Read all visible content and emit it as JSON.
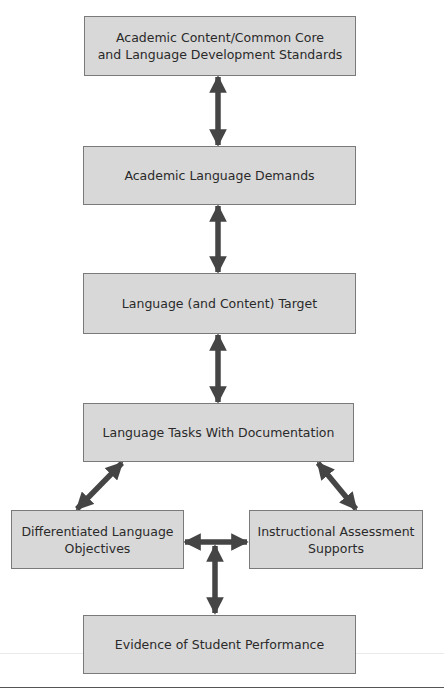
{
  "diagram": {
    "colors": {
      "box_fill": "#d8d8d8",
      "box_border": "#7a7a7a",
      "arrow": "#454545",
      "text": "#2a2a2a"
    },
    "nodes": [
      {
        "id": "standards",
        "label": "Academic Content/Common Core\nand Language Development Standards"
      },
      {
        "id": "demands",
        "label": "Academic Language Demands"
      },
      {
        "id": "target",
        "label": "Language (and Content) Target"
      },
      {
        "id": "tasks",
        "label": "Language Tasks With Documentation"
      },
      {
        "id": "objectives",
        "label": "Differentiated Language\nObjectives"
      },
      {
        "id": "supports",
        "label": "Instructional Assessment\nSupports"
      },
      {
        "id": "evidence",
        "label": "Evidence of Student Performance"
      }
    ],
    "edges": [
      {
        "from": "standards",
        "to": "demands",
        "type": "bidirectional"
      },
      {
        "from": "demands",
        "to": "target",
        "type": "bidirectional"
      },
      {
        "from": "target",
        "to": "tasks",
        "type": "bidirectional"
      },
      {
        "from": "tasks",
        "to": "objectives",
        "type": "bidirectional"
      },
      {
        "from": "tasks",
        "to": "supports",
        "type": "bidirectional"
      },
      {
        "from": "objectives",
        "to": "supports",
        "type": "bidirectional"
      },
      {
        "from": "objectives-supports-junction",
        "to": "evidence",
        "type": "bidirectional"
      }
    ]
  }
}
